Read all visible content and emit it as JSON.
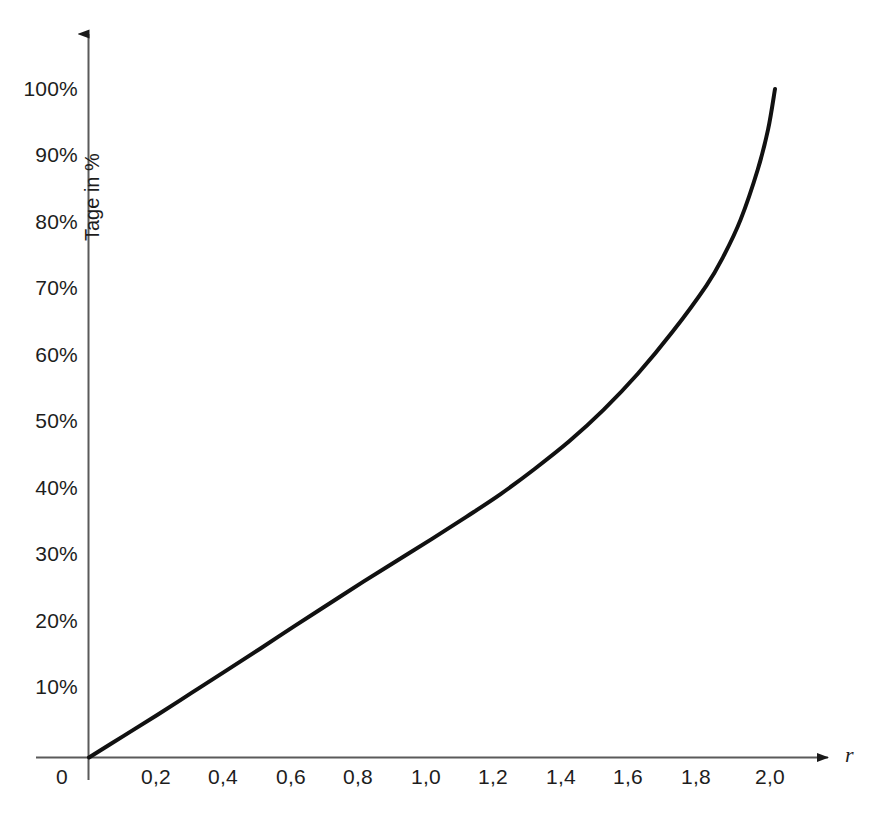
{
  "chart_data": {
    "type": "line",
    "title": "",
    "xlabel": "r",
    "ylabel": "Tage in %",
    "xlim": [
      0,
      2.05
    ],
    "ylim": [
      0,
      1.03
    ],
    "grid": false,
    "legend": null,
    "x_tick_labels": [
      "0",
      "0,2",
      "0,4",
      "0,6",
      "0,8",
      "1,0",
      "1,2",
      "1,4",
      "1,6",
      "1,8",
      "2,0"
    ],
    "x_tick_values": [
      0,
      0.2,
      0.4,
      0.6,
      0.8,
      1.0,
      1.2,
      1.4,
      1.6,
      1.8,
      2.0
    ],
    "y_tick_labels": [
      "10%",
      "20%",
      "30%",
      "40%",
      "50%",
      "60%",
      "70%",
      "80%",
      "90%",
      "100%"
    ],
    "y_tick_values": [
      10,
      20,
      30,
      40,
      50,
      60,
      70,
      80,
      90,
      100
    ],
    "series": [
      {
        "name": "Tage in %",
        "color": "#000000",
        "x": [
          0.0,
          0.1,
          0.2,
          0.3,
          0.4,
          0.5,
          0.6,
          0.7,
          0.8,
          0.9,
          1.0,
          1.1,
          1.2,
          1.3,
          1.4,
          1.5,
          1.6,
          1.7,
          1.8,
          1.85,
          1.9,
          1.95,
          1.98,
          2.0
        ],
        "values": [
          0,
          3.2,
          6.4,
          9.7,
          13.0,
          16.3,
          19.7,
          23.0,
          26.3,
          29.5,
          32.7,
          36.0,
          39.4,
          43.2,
          47.3,
          52.0,
          57.4,
          63.6,
          70.6,
          75.0,
          80.5,
          88.0,
          94.0,
          100.0
        ]
      }
    ],
    "axis_style": {
      "arrow_heads": true,
      "axis_color": "#555555",
      "curve_color": "#111111",
      "curve_width_px": 4
    }
  },
  "axes": {
    "origin_label": "0",
    "y_title": "Tage in %",
    "x_title": "r"
  }
}
